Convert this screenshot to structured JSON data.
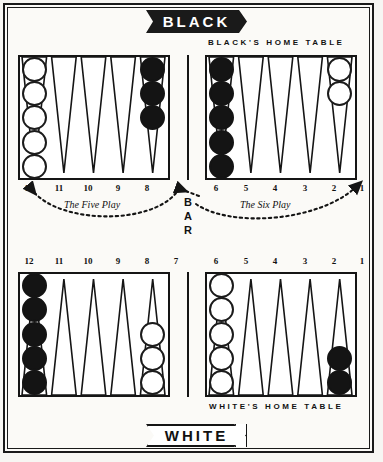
{
  "figure": {
    "title_top": "BLACK",
    "title_bottom": "WHITE",
    "caption_black_home": "BLACK'S HOME TABLE",
    "caption_white_home": "WHITE'S HOME TABLE",
    "bar_label": "BAR"
  },
  "annotations": [
    {
      "id": "five-play",
      "text": "The Five Play",
      "side": "left"
    },
    {
      "id": "six-play",
      "text": "The Six Play",
      "side": "right"
    }
  ],
  "point_numbers": {
    "top_left": [
      "12",
      "11",
      "10",
      "9",
      "8"
    ],
    "top_right": [
      "6",
      "5",
      "4",
      "3",
      "2",
      "1"
    ],
    "bottom_left": [
      "12",
      "11",
      "10",
      "9",
      "8",
      "7"
    ],
    "bottom_right": [
      "6",
      "5",
      "4",
      "3",
      "2",
      "1"
    ]
  },
  "board": {
    "quadrants": [
      {
        "id": "top-left",
        "name": "black-outer-table",
        "points": [
          {
            "number": "12",
            "color": "white",
            "count": 5
          },
          {
            "number": "11",
            "color": null,
            "count": 0
          },
          {
            "number": "10",
            "color": null,
            "count": 0
          },
          {
            "number": "9",
            "color": null,
            "count": 0
          },
          {
            "number": "8",
            "color": "black",
            "count": 3
          }
        ]
      },
      {
        "id": "top-right",
        "name": "black-home-table",
        "points": [
          {
            "number": "6",
            "color": "black",
            "count": 5
          },
          {
            "number": "5",
            "color": null,
            "count": 0
          },
          {
            "number": "4",
            "color": null,
            "count": 0
          },
          {
            "number": "3",
            "color": null,
            "count": 0
          },
          {
            "number": "2",
            "color": null,
            "count": 0
          },
          {
            "number": "1",
            "color": "white",
            "count": 2
          }
        ]
      },
      {
        "id": "bottom-left",
        "name": "white-outer-table",
        "points": [
          {
            "number": "12",
            "color": "black",
            "count": 5
          },
          {
            "number": "11",
            "color": null,
            "count": 0
          },
          {
            "number": "10",
            "color": null,
            "count": 0
          },
          {
            "number": "9",
            "color": null,
            "count": 0
          },
          {
            "number": "8",
            "color": "white",
            "count": 3
          },
          {
            "number": "7",
            "color": null,
            "count": 0
          }
        ]
      },
      {
        "id": "bottom-right",
        "name": "white-home-table",
        "points": [
          {
            "number": "6",
            "color": "white",
            "count": 5
          },
          {
            "number": "5",
            "color": null,
            "count": 0
          },
          {
            "number": "4",
            "color": null,
            "count": 0
          },
          {
            "number": "3",
            "color": null,
            "count": 0
          },
          {
            "number": "2",
            "color": null,
            "count": 0
          },
          {
            "number": "1",
            "color": "black",
            "count": 2
          }
        ]
      }
    ]
  },
  "colors": {
    "ink": "#141414",
    "paper": "#fbfaf7",
    "checker_white_fill": "#ffffff",
    "checker_black_fill": "#141414"
  }
}
